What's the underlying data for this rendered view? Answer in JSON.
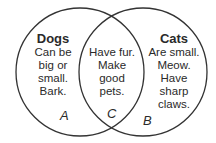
{
  "diagram": {
    "type": "venn",
    "sets": [
      {
        "id": "A",
        "title": "Dogs",
        "lines": [
          "Can be",
          "big or",
          "small.",
          "Bark."
        ],
        "label": "A"
      },
      {
        "id": "B",
        "title": "Cats",
        "lines": [
          "Are small.",
          "Meow.",
          "Have",
          "sharp",
          "claws."
        ],
        "label": "B"
      }
    ],
    "intersection": {
      "id": "C",
      "lines": [
        "Have fur.",
        "Make",
        "good",
        "pets."
      ],
      "label": "C"
    },
    "stroke_color": "#2a2a2a"
  }
}
